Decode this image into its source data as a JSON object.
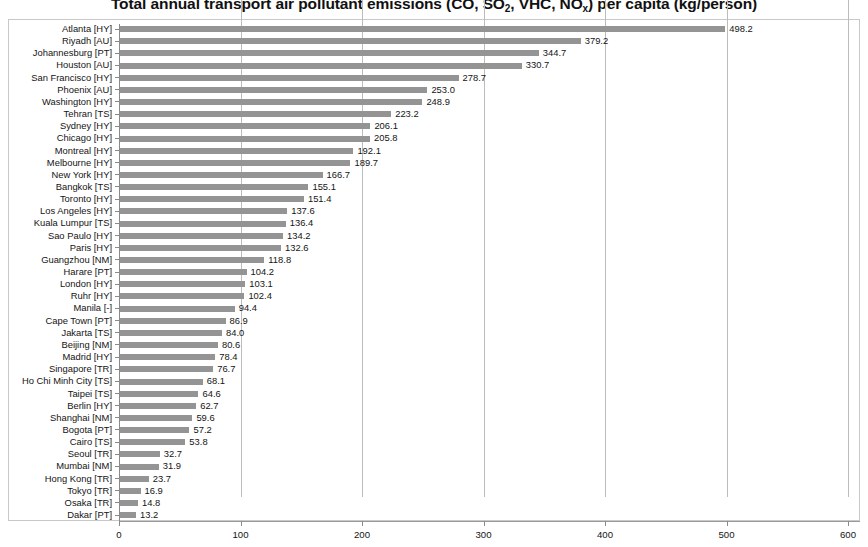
{
  "chart_data": {
    "type": "bar",
    "orientation": "horizontal",
    "title": "Total annual transport air pollutant emissions (CO, SO2, VHC, NOx) per capita (kg/person)",
    "title_parts": {
      "lead": "Total annual transport air pollutant emissions (CO, SO",
      "sub1": "2",
      "mid": ", VHC, NO",
      "sub2": "x",
      "tail": ") per capita (kg/person)"
    },
    "xlabel": "",
    "ylabel": "",
    "xlim": [
      0,
      600
    ],
    "xticks": [
      0,
      100,
      200,
      300,
      400,
      500,
      600
    ],
    "xtick_labels": [
      "0",
      "100",
      "200",
      "300",
      "400",
      "500",
      "600"
    ],
    "grid": true,
    "grid_axis": "x",
    "legend": false,
    "bar_color": "#949494",
    "categories": [
      "Atlanta [HY]",
      "Riyadh [AU]",
      "Johannesburg [PT]",
      "Houston [AU]",
      "San Francisco [HY]",
      "Phoenix [AU]",
      "Washington [HY]",
      "Tehran [TS]",
      "Sydney [HY]",
      "Chicago [HY]",
      "Montreal [HY]",
      "Melbourne [HY]",
      "New York [HY]",
      "Bangkok [TS]",
      "Toronto [HY]",
      "Los Angeles [HY]",
      "Kuala Lumpur [TS]",
      "Sao Paulo [HY]",
      "Paris [HY]",
      "Guangzhou [NM]",
      "Harare [PT]",
      "London [HY]",
      "Ruhr [HY]",
      "Manila [-]",
      "Cape Town [PT]",
      "Jakarta [TS]",
      "Beijing [NM]",
      "Madrid [HY]",
      "Singapore [TR]",
      "Ho Chi Minh City [TS]",
      "Taipei [TS]",
      "Berlin [HY]",
      "Shanghai [NM]",
      "Bogota [PT]",
      "Cairo [TS]",
      "Seoul [TR]",
      "Mumbai [NM]",
      "Hong Kong [TR]",
      "Tokyo [TR]",
      "Osaka [TR]",
      "Dakar [PT]"
    ],
    "values": [
      498.2,
      379.2,
      344.7,
      330.7,
      278.7,
      253.0,
      248.9,
      223.2,
      206.1,
      205.8,
      192.1,
      189.7,
      166.7,
      155.1,
      151.4,
      137.6,
      136.4,
      134.2,
      132.6,
      118.8,
      104.2,
      103.1,
      102.4,
      94.4,
      86.9,
      84.0,
      80.6,
      78.4,
      76.7,
      68.1,
      64.6,
      62.7,
      59.6,
      57.2,
      53.8,
      32.7,
      31.9,
      23.7,
      16.9,
      14.8,
      13.2
    ],
    "value_labels": [
      "498.2",
      "379.2",
      "344.7",
      "330.7",
      "278.7",
      "253.0",
      "248.9",
      "223.2",
      "206.1",
      "205.8",
      "192.1",
      "189.7",
      "166.7",
      "155.1",
      "151.4",
      "137.6",
      "136.4",
      "134.2",
      "132.6",
      "118.8",
      "104.2",
      "103.1",
      "102.4",
      "94.4",
      "86.9",
      "84.0",
      "80.6",
      "78.4",
      "76.7",
      "68.1",
      "64.6",
      "62.7",
      "59.6",
      "57.2",
      "53.8",
      "32.7",
      "31.9",
      "23.7",
      "16.9",
      "14.8",
      "13.2"
    ]
  }
}
